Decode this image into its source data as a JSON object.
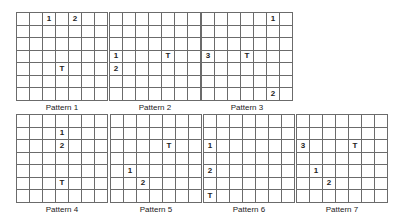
{
  "figure": {
    "grid_size": {
      "rows": 7,
      "cols": 7
    },
    "patterns": [
      {
        "label": "Pattern 1",
        "x": 16,
        "y": 12,
        "marks": [
          {
            "r": 0,
            "c": 2,
            "t": "1"
          },
          {
            "r": 0,
            "c": 4,
            "t": "2"
          },
          {
            "r": 4,
            "c": 3,
            "t": "T"
          }
        ]
      },
      {
        "label": "Pattern 2",
        "x": 109,
        "y": 12,
        "marks": [
          {
            "r": 3,
            "c": 0,
            "t": "1"
          },
          {
            "r": 3,
            "c": 4,
            "t": "T"
          },
          {
            "r": 4,
            "c": 0,
            "t": "2"
          }
        ]
      },
      {
        "label": "Pattern 3",
        "x": 201,
        "y": 12,
        "marks": [
          {
            "r": 0,
            "c": 5,
            "t": "1"
          },
          {
            "r": 3,
            "c": 0,
            "t": "3"
          },
          {
            "r": 3,
            "c": 3,
            "t": "T"
          },
          {
            "r": 6,
            "c": 5,
            "t": "2"
          }
        ]
      },
      {
        "label": "Pattern 4",
        "x": 16,
        "y": 114,
        "marks": [
          {
            "r": 1,
            "c": 3,
            "t": "1"
          },
          {
            "r": 2,
            "c": 3,
            "t": "2"
          },
          {
            "r": 5,
            "c": 3,
            "t": "T"
          }
        ]
      },
      {
        "label": "Pattern 5",
        "x": 110,
        "y": 114,
        "marks": [
          {
            "r": 2,
            "c": 4,
            "t": "T"
          },
          {
            "r": 4,
            "c": 1,
            "t": "1"
          },
          {
            "r": 5,
            "c": 2,
            "t": "2"
          }
        ]
      },
      {
        "label": "Pattern 6",
        "x": 203,
        "y": 114,
        "marks": [
          {
            "r": 2,
            "c": 0,
            "t": "1"
          },
          {
            "r": 4,
            "c": 0,
            "t": "2"
          },
          {
            "r": 6,
            "c": 0,
            "t": "T"
          }
        ]
      },
      {
        "label": "Pattern 7",
        "x": 296,
        "y": 114,
        "marks": [
          {
            "r": 2,
            "c": 0,
            "t": "3"
          },
          {
            "r": 2,
            "c": 4,
            "t": "T"
          },
          {
            "r": 4,
            "c": 1,
            "t": "1"
          },
          {
            "r": 5,
            "c": 2,
            "t": "2"
          }
        ]
      }
    ]
  }
}
